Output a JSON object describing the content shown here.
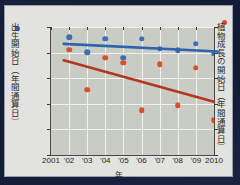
{
  "figure": {
    "axis_left_label": "出生開始日（年間通算日）",
    "axis_right_label": "植物成長の開始日（年間通算日）",
    "axis_x_label": "年",
    "legend_blue_name": "bird-series-marker",
    "legend_red_name": "plant-series-marker"
  },
  "chart_data": {
    "type": "scatter",
    "title": "",
    "xlabel": "年",
    "ylabel": "出生開始日（年間通算日）",
    "ylabel_right": "植物成長の開始日（年間通算日）",
    "xlim": [
      2001,
      2010
    ],
    "ylim": [
      110,
      160
    ],
    "ylim_right": [
      110,
      160
    ],
    "yticks": [
      110,
      120,
      130,
      140,
      150,
      160
    ],
    "yticks_right": [
      110,
      120,
      130,
      140,
      150,
      160
    ],
    "grid": true,
    "legend_position": "axis-labels",
    "x": [
      2002,
      2003,
      2004,
      2005,
      2006,
      2007,
      2008,
      2009,
      2010
    ],
    "xtick_labels": [
      "2001",
      "'02",
      "'03",
      "'04",
      "'05",
      "'06",
      "'07",
      "'08",
      "'09",
      "2010"
    ],
    "xticks": [
      2001,
      2002,
      2003,
      2004,
      2005,
      2006,
      2007,
      2008,
      2009,
      2010
    ],
    "series": [
      {
        "name": "出生開始日（年間通算日）",
        "color": "#3c6fb5",
        "axis": "left",
        "marker": "circle",
        "values": [
          156.0,
          150.2,
          155.5,
          148.0,
          155.5,
          151.5,
          151.0,
          153.5,
          149.5
        ],
        "trendline": {
          "color": "#2f63ad",
          "x_start": 2001.7,
          "x_end": 2010.2,
          "y_start": 153.4,
          "y_end": 150.4
        }
      },
      {
        "name": "植物成長の開始日（年間通算日）",
        "color": "#d4522e",
        "axis": "right",
        "marker": "circle",
        "values": [
          151.2,
          135.5,
          148.0,
          146.0,
          127.5,
          145.5,
          129.5,
          144.0,
          123.5
        ],
        "trendline": {
          "color": "#b53520",
          "x_start": 2001.7,
          "x_end": 2010.0,
          "y_start": 147.0,
          "y_end": 130.8
        }
      }
    ]
  }
}
